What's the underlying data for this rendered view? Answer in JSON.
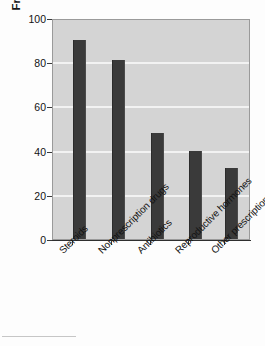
{
  "chart_data": {
    "type": "bar",
    "title": "",
    "xlabel": "",
    "ylabel": "Frequency of detection (%)",
    "categories": [
      "Steroids",
      "Nonprescription drugs",
      "Antibiotics",
      "Reproductive hormones",
      "Other prescription drugs"
    ],
    "values": [
      90,
      81,
      48,
      40,
      32
    ],
    "ylim": [
      0,
      100
    ],
    "yticks": [
      100,
      80,
      60,
      40,
      20,
      0
    ],
    "grid": true,
    "legend": null,
    "bar_color": "#3a3a3a",
    "plot_background": "#d4d4d4",
    "gridline_color": "#f2f2f2"
  }
}
